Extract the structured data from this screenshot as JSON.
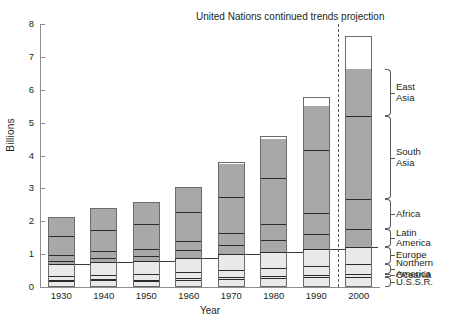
{
  "chart_data": {
    "type": "bar",
    "stacked": true,
    "title": "United Nations continued trends projection",
    "xlabel": "Year",
    "ylabel": "Billions",
    "ylim": [
      0,
      8
    ],
    "yticks": [
      0,
      1,
      2,
      3,
      4,
      5,
      6,
      7,
      8
    ],
    "ytick_labels": [
      "0",
      "1",
      "2",
      "3",
      "4",
      "5",
      "6",
      "7",
      "8"
    ],
    "grid": false,
    "legend_position": "right",
    "categories": [
      "1930",
      "1940",
      "1950",
      "1960",
      "1970",
      "1980",
      "1990",
      "2000"
    ],
    "series": [
      {
        "name": "U.S.S.R.",
        "shade": "light",
        "values": [
          0.18,
          0.2,
          0.18,
          0.21,
          0.24,
          0.27,
          0.29,
          0.31
        ]
      },
      {
        "name": "Oceania",
        "shade": "light",
        "values": [
          0.03,
          0.03,
          0.04,
          0.05,
          0.06,
          0.07,
          0.08,
          0.09
        ]
      },
      {
        "name": "Northern America",
        "shade": "light",
        "values": [
          0.13,
          0.14,
          0.17,
          0.2,
          0.23,
          0.25,
          0.28,
          0.3
        ]
      },
      {
        "name": "Europe",
        "shade": "light",
        "values": [
          0.35,
          0.39,
          0.39,
          0.43,
          0.46,
          0.48,
          0.5,
          0.52
        ]
      },
      {
        "name": "Latin America",
        "shade": "dark",
        "values": [
          0.11,
          0.13,
          0.17,
          0.22,
          0.29,
          0.37,
          0.45,
          0.54
        ]
      },
      {
        "name": "Africa",
        "shade": "dark",
        "values": [
          0.16,
          0.19,
          0.22,
          0.28,
          0.36,
          0.48,
          0.66,
          0.91
        ]
      },
      {
        "name": "South Asia",
        "shade": "dark",
        "values": [
          0.6,
          0.66,
          0.75,
          0.89,
          1.09,
          1.41,
          1.92,
          2.52
        ]
      },
      {
        "name": "East Asia",
        "shade": "dark",
        "values": [
          0.58,
          0.66,
          0.67,
          0.77,
          1.01,
          1.17,
          1.32,
          1.44
        ]
      }
    ],
    "totals": [
      2.14,
      2.4,
      2.59,
      3.05,
      3.8,
      4.6,
      5.78,
      7.63
    ],
    "projection_divider_after": "1990",
    "annotations": {
      "projection_note": "United Nations continued trends projection"
    },
    "colors": {
      "light_shade": "#e9e9e9",
      "dark_shade": "#a8a8a8",
      "outline": "#6b6b6b",
      "divider": "#2b2b2b",
      "axis": "#8d8d8d",
      "text": "#231f20"
    }
  },
  "legend": {
    "items": [
      {
        "label": "East\nAsia"
      },
      {
        "label": "South\nAsia"
      },
      {
        "label": "Africa"
      },
      {
        "label": "Latin\nAmerica"
      },
      {
        "label": "Europe"
      },
      {
        "label": "Northern\nAmerica"
      },
      {
        "label": "Oceania"
      },
      {
        "label": "U.S.S.R."
      }
    ]
  }
}
